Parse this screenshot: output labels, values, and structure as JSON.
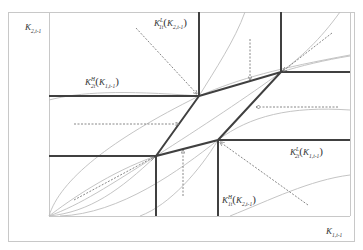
{
  "diagram": {
    "type": "phase-diagram",
    "axes": {
      "y_label": {
        "base": "K",
        "sub": "2,t-1"
      },
      "x_label": {
        "base": "K",
        "sub": "1,t-1"
      }
    },
    "curve_labels": [
      {
        "id": "top",
        "base": "K",
        "sup": "L",
        "sub": "1t",
        "arg_base": "K",
        "arg_sub": "2,t-1"
      },
      {
        "id": "left",
        "base": "K",
        "sup": "H",
        "sub": "2t",
        "arg_base": "K",
        "arg_sub": "1,t-1"
      },
      {
        "id": "right",
        "base": "K",
        "sup": "L",
        "sub": "2t",
        "arg_base": "K",
        "arg_sub": "1,t-1"
      },
      {
        "id": "bottom",
        "base": "K",
        "sup": "H",
        "sub": "1t",
        "arg_base": "K",
        "arg_sub": "2,t-1"
      }
    ],
    "colors": {
      "frame": "#c8c8c8",
      "thick_line": "#404040",
      "thin_curve": "#bdbdbd",
      "arrow": "#7a7a7a"
    }
  }
}
